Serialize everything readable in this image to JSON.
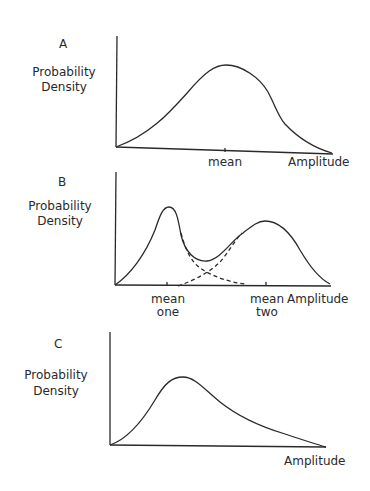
{
  "panels": [
    {
      "letter": "A",
      "ylabel_line1": "Probability",
      "ylabel_line2": "Density",
      "xlabel": "Amplitude",
      "tick_labels": [
        "mean"
      ],
      "description": "Single symmetric (Gaussian) distribution"
    },
    {
      "letter": "B",
      "ylabel_line1": "Probability",
      "ylabel_line2": "Density",
      "xlabel": "Amplitude",
      "tick_labels": [
        {
          "line1": "mean",
          "line2": "one"
        },
        {
          "line1": "mean",
          "line2": "two"
        }
      ],
      "description": "Bimodal distribution composed of two overlapping components (dashed)"
    },
    {
      "letter": "C",
      "ylabel_line1": "Probability",
      "ylabel_line2": "Density",
      "xlabel": "Amplitude",
      "tick_labels": [],
      "description": "Right-skewed distribution"
    }
  ],
  "colors": {
    "line": "#2a2a2a",
    "background": "#ffffff"
  }
}
